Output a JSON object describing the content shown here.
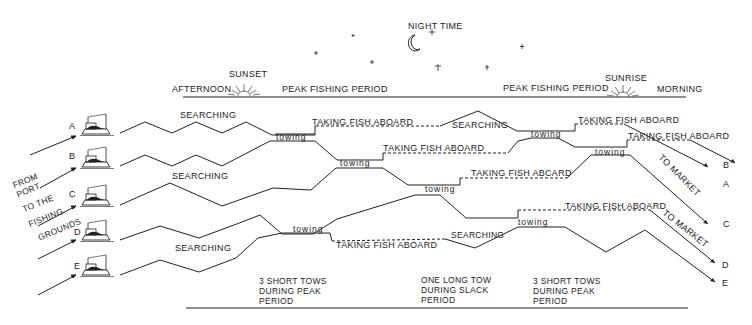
{
  "top_labels": {
    "night_time": "NIGHT TIME",
    "afternoon": "AFTERNOON",
    "sunset": "SUNSET",
    "peak_left": "PEAK FISHING PERIOD",
    "peak_right": "PEAK FISHING PERIOD",
    "sunrise": "SUNRISE",
    "morning": "MORNING"
  },
  "from_port": [
    "FROM",
    "PORT",
    "TO THE",
    "FISHING",
    "GROUNDS"
  ],
  "boats": [
    {
      "id": "A",
      "label": "A"
    },
    {
      "id": "B",
      "label": "B"
    },
    {
      "id": "C",
      "label": "C"
    },
    {
      "id": "D",
      "label": "D"
    },
    {
      "id": "E",
      "label": "E"
    }
  ],
  "activity_labels": {
    "searching": "SEARCHING",
    "towing": "towing",
    "taking_fish_aboard": "TAKING FISH ABOARD",
    "taking_fish_aboard_alt": "TAKING FISH ABCARD",
    "to_market": "TO MARKET"
  },
  "end_labels": [
    "B",
    "A",
    "C",
    "D",
    "E"
  ],
  "bottom_notes": [
    {
      "lines": [
        "3 SHORT  TOWS",
        "DURING  PEAK",
        "PERIOD"
      ]
    },
    {
      "lines": [
        "ONE LONG TOW",
        "DURING SLACK",
        "PERIOD"
      ]
    },
    {
      "lines": [
        "3 SHORT  TOWS",
        "DURING  PEAK",
        "PERIOD"
      ]
    }
  ]
}
